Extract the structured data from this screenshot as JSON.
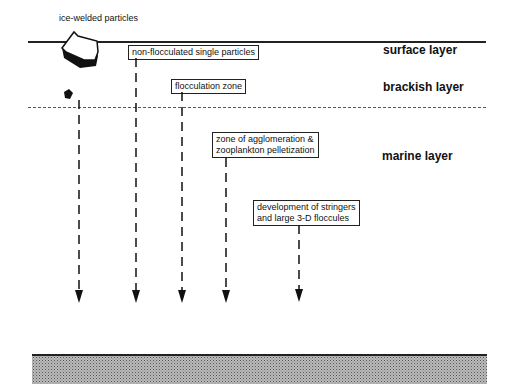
{
  "diagram": {
    "type": "vertical particle flux / flocculation schematic",
    "source_label": "ice-welded particles",
    "layers": [
      {
        "id": "surface",
        "label": "surface layer"
      },
      {
        "id": "brackish",
        "label": "brackish layer"
      },
      {
        "id": "marine",
        "label": "marine layer"
      }
    ],
    "process_boxes": [
      {
        "id": "non-flocculated",
        "lines": [
          "non-flocculated single particles"
        ]
      },
      {
        "id": "flocculation",
        "lines": [
          "flocculation zone"
        ]
      },
      {
        "id": "agglomeration",
        "lines": [
          "zone of agglomeration &",
          "zooplankton pelletization"
        ]
      },
      {
        "id": "stringers",
        "lines": [
          "development of stringers",
          "and large 3-D floccules"
        ]
      }
    ],
    "arrows_count": 5,
    "colors": {
      "line": "#222222",
      "dashed": "#555555",
      "sediment": "#bbbbbb"
    }
  }
}
